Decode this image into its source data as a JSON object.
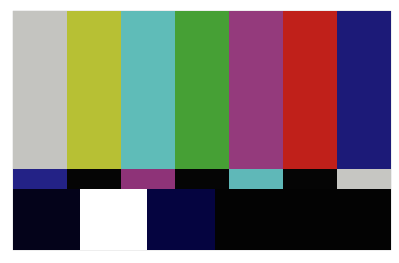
{
  "top_bars": [
    {
      "name": "gray",
      "color": "#c4c4c0",
      "width": 54
    },
    {
      "name": "yellow",
      "color": "#b7c034",
      "width": 54
    },
    {
      "name": "cyan",
      "color": "#5fbcb8",
      "width": 54
    },
    {
      "name": "green",
      "color": "#46a035",
      "width": 54
    },
    {
      "name": "magenta",
      "color": "#943a7c",
      "width": 54
    },
    {
      "name": "red",
      "color": "#c0201a",
      "width": 54
    },
    {
      "name": "blue",
      "color": "#1c1a78",
      "width": 54
    }
  ],
  "middle_bars": [
    {
      "name": "blue",
      "color": "#232286",
      "width": 54
    },
    {
      "name": "black",
      "color": "#050505",
      "width": 54
    },
    {
      "name": "magenta",
      "color": "#8e3378",
      "width": 54
    },
    {
      "name": "black",
      "color": "#050505",
      "width": 54
    },
    {
      "name": "cyan",
      "color": "#5fb8b8",
      "width": 54
    },
    {
      "name": "black",
      "color": "#050505",
      "width": 54
    },
    {
      "name": "gray",
      "color": "#c6c6c2",
      "width": 54
    }
  ],
  "bottom_bars": [
    {
      "name": "dark-navy",
      "color": "#04031a",
      "width": 67
    },
    {
      "name": "white",
      "color": "#ffffff",
      "width": 67
    },
    {
      "name": "navy",
      "color": "#050440",
      "width": 68
    },
    {
      "name": "black",
      "color": "#030303",
      "width": 176
    }
  ]
}
